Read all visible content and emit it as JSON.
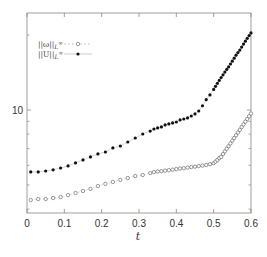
{
  "chart_data": {
    "type": "scatter",
    "title": "",
    "xlabel": "t",
    "ylabel": "",
    "xlim": [
      0,
      0.6
    ],
    "ylim": [
      3.85,
      24.5
    ],
    "yscale": "log",
    "grid": false,
    "legend_position": "top-left",
    "x_ticks": [
      0,
      0.1,
      0.2,
      0.3,
      0.4,
      0.5,
      0.6
    ],
    "x_tick_labels": [
      "0",
      "0.1",
      "0.2",
      "0.3",
      "0.4",
      "0.5",
      "0.6"
    ],
    "y_major_ticks": [
      10
    ],
    "y_tick_labels": [
      "10"
    ],
    "y_minor_ticks": [
      4,
      5,
      6,
      7,
      8,
      9,
      20
    ],
    "series": [
      {
        "name": "||ω||_L∞",
        "label_main": "||ω||",
        "label_sub": "L",
        "label_sup": "∞",
        "marker": "open-circle",
        "line": "dashed",
        "color": "#555555",
        "x": [
          0.01,
          0.03,
          0.05,
          0.07,
          0.09,
          0.11,
          0.13,
          0.15,
          0.17,
          0.19,
          0.21,
          0.23,
          0.25,
          0.27,
          0.29,
          0.31,
          0.33,
          0.34,
          0.35,
          0.36,
          0.37,
          0.38,
          0.39,
          0.4,
          0.41,
          0.42,
          0.43,
          0.44,
          0.45,
          0.46,
          0.47,
          0.48,
          0.49,
          0.5,
          0.505,
          0.51,
          0.515,
          0.52,
          0.525,
          0.53,
          0.535,
          0.54,
          0.545,
          0.55,
          0.555,
          0.56,
          0.565,
          0.57,
          0.575,
          0.58,
          0.585,
          0.59,
          0.595,
          0.6
        ],
        "y": [
          4.35,
          4.39,
          4.39,
          4.43,
          4.47,
          4.55,
          4.64,
          4.73,
          4.82,
          4.95,
          5.05,
          5.14,
          5.24,
          5.33,
          5.43,
          5.48,
          5.58,
          5.63,
          5.66,
          5.68,
          5.71,
          5.73,
          5.76,
          5.79,
          5.82,
          5.84,
          5.87,
          5.9,
          5.92,
          5.95,
          5.98,
          6.01,
          6.06,
          6.12,
          6.2,
          6.3,
          6.41,
          6.48,
          6.65,
          6.82,
          6.99,
          7.16,
          7.34,
          7.53,
          7.72,
          7.92,
          8.12,
          8.32,
          8.54,
          8.75,
          8.98,
          9.2,
          9.44,
          9.68
        ]
      },
      {
        "name": "||U||_L∞",
        "label_main": "||U||",
        "label_sub": "L",
        "label_sup": "∞",
        "marker": "filled-circle",
        "line": "solid",
        "color": "#111111",
        "x": [
          0.01,
          0.03,
          0.05,
          0.07,
          0.09,
          0.11,
          0.13,
          0.15,
          0.17,
          0.19,
          0.21,
          0.23,
          0.25,
          0.27,
          0.29,
          0.31,
          0.33,
          0.34,
          0.35,
          0.36,
          0.37,
          0.38,
          0.39,
          0.4,
          0.41,
          0.42,
          0.43,
          0.44,
          0.45,
          0.46,
          0.47,
          0.48,
          0.49,
          0.5,
          0.505,
          0.51,
          0.515,
          0.52,
          0.525,
          0.53,
          0.535,
          0.54,
          0.545,
          0.55,
          0.555,
          0.56,
          0.565,
          0.57,
          0.575,
          0.58,
          0.585,
          0.59,
          0.595,
          0.6
        ],
        "y": [
          5.64,
          5.64,
          5.69,
          5.75,
          5.85,
          5.96,
          6.13,
          6.3,
          6.48,
          6.66,
          6.78,
          7.04,
          7.17,
          7.44,
          7.72,
          8.01,
          8.23,
          8.39,
          8.47,
          8.55,
          8.71,
          8.79,
          8.87,
          8.95,
          9.12,
          9.2,
          9.29,
          9.46,
          9.64,
          9.91,
          10.4,
          11.0,
          11.5,
          12.1,
          12.45,
          12.8,
          13.15,
          13.5,
          13.85,
          14.2,
          14.55,
          14.9,
          15.3,
          15.7,
          16.15,
          16.6,
          17.0,
          17.4,
          17.9,
          18.4,
          18.9,
          19.4,
          19.9,
          20.4
        ]
      }
    ]
  }
}
